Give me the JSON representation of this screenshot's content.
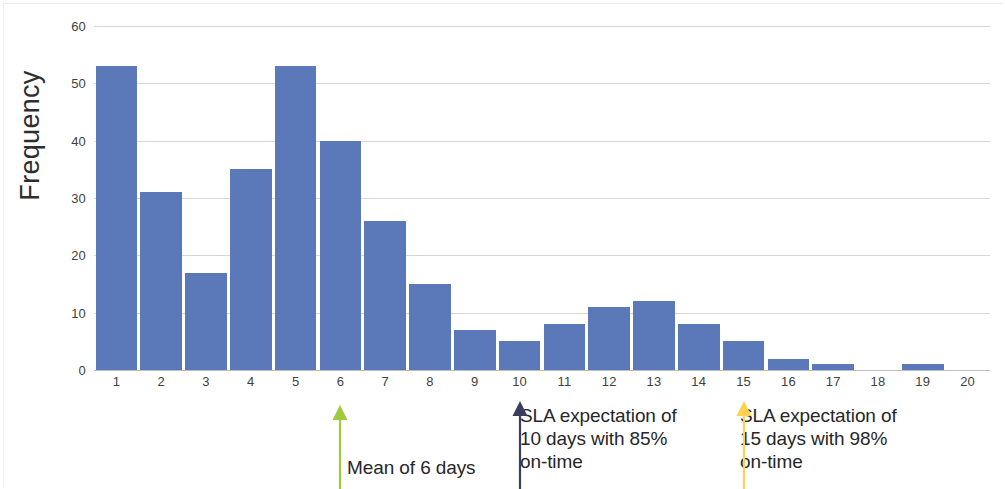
{
  "chart_data": {
    "type": "bar",
    "title": "",
    "subtitle": "",
    "xlabel": "",
    "ylabel": "Frequency",
    "categories": [
      1,
      2,
      3,
      4,
      5,
      6,
      7,
      8,
      9,
      10,
      11,
      12,
      13,
      14,
      15,
      16,
      17,
      18,
      19,
      20
    ],
    "values": [
      53,
      31,
      17,
      35,
      53,
      40,
      26,
      15,
      7,
      5,
      8,
      11,
      12,
      8,
      5,
      2,
      1,
      0,
      1,
      0
    ],
    "ylim": [
      0,
      60
    ],
    "yticks": [
      0,
      10,
      20,
      30,
      40,
      50,
      60
    ],
    "grid": true,
    "legend": "none",
    "bar_color": "#5b79b9",
    "annotations": [
      {
        "id": "mean",
        "text": "Mean of 6 days",
        "at_category": 6,
        "color": "#9ecb3c",
        "arrow": "up"
      },
      {
        "id": "sla10",
        "text": "SLA expectation of\n10 days with 85%\non-time",
        "at_category": 10,
        "color": "#3d3d5e",
        "arrow": "up"
      },
      {
        "id": "sla15",
        "text": "SLA expectation of\n15 days with 98%\non-time",
        "at_category": 15,
        "color": "#ffd24d",
        "arrow": "up"
      }
    ]
  }
}
